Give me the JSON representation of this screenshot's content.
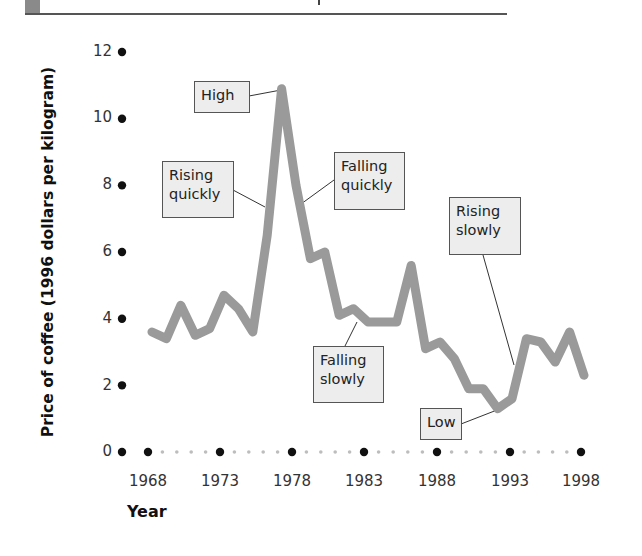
{
  "header": {
    "accent_block_color": "#8a8a8a",
    "rule_color": "#555555"
  },
  "chart_data": {
    "type": "line",
    "title": "",
    "xlabel": "Year",
    "ylabel": "Price of coffee (1996 dollars per kilogram)",
    "xlim": [
      1966,
      1999
    ],
    "ylim": [
      0,
      12
    ],
    "grid": false,
    "legend": null,
    "x_ticks": [
      "1968",
      "1973",
      "1978",
      "1983",
      "1988",
      "1993",
      "1998"
    ],
    "y_ticks": [
      "0",
      "2",
      "4",
      "6",
      "8",
      "10",
      "12"
    ],
    "series": [
      {
        "name": "Price of coffee",
        "color": "#9a9a9a",
        "x": [
          1968,
          1969,
          1970,
          1971,
          1972,
          1973,
          1974,
          1975,
          1976,
          1977,
          1978,
          1979,
          1980,
          1981,
          1982,
          1983,
          1984,
          1985,
          1986,
          1987,
          1988,
          1989,
          1990,
          1991,
          1992,
          1993,
          1994,
          1995,
          1996,
          1997,
          1998
        ],
        "values": [
          3.6,
          3.4,
          4.4,
          3.5,
          3.7,
          4.7,
          4.3,
          3.6,
          6.5,
          10.9,
          8.0,
          5.8,
          6.0,
          4.1,
          4.3,
          3.9,
          3.9,
          3.9,
          5.6,
          3.1,
          3.3,
          2.8,
          1.9,
          1.9,
          1.3,
          1.6,
          3.4,
          3.3,
          2.7,
          3.6,
          2.3
        ]
      }
    ],
    "annotations": [
      {
        "text": "High",
        "target_year": 1977,
        "target_value": 10.9
      },
      {
        "text": "Rising quickly",
        "target_year": 1976,
        "target_value": 7.8
      },
      {
        "text": "Falling quickly",
        "target_year": 1978,
        "target_value": 8.0
      },
      {
        "text": "Falling slowly",
        "target_year": 1982,
        "target_value": 4.2
      },
      {
        "text": "Low",
        "target_year": 1992,
        "target_value": 1.3
      },
      {
        "text": "Rising slowly",
        "target_year": 1994,
        "target_value": 2.9
      }
    ]
  },
  "labels": {
    "ylabel": "Price of coffee (1996 dollars per kilogram)",
    "xlabel": "Year",
    "y_ticks": [
      "0",
      "2",
      "4",
      "6",
      "8",
      "10",
      "12"
    ],
    "x_ticks": [
      "1968",
      "1973",
      "1978",
      "1983",
      "1988",
      "1993",
      "1998"
    ],
    "annotations": {
      "high": "High",
      "rising_quickly_1": "Rising",
      "rising_quickly_2": "quickly",
      "falling_quickly_1": "Falling",
      "falling_quickly_2": "quickly",
      "falling_slowly_1": "Falling",
      "falling_slowly_2": "slowly",
      "low": "Low",
      "rising_slowly_1": "Rising",
      "rising_slowly_2": "slowly"
    }
  }
}
